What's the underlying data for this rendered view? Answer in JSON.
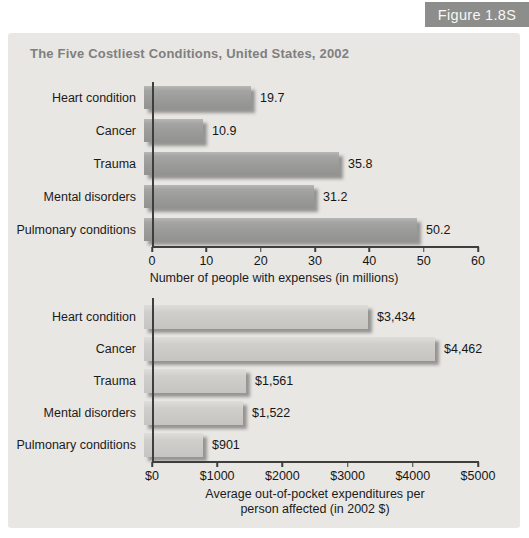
{
  "figure_tag": "Figure 1.8S",
  "title": "The Five Costliest Conditions, United States, 2002",
  "colors": {
    "panel_bg": "#e8e7e4",
    "figure_tag_bg": "#8d8d8b",
    "figure_tag_text": "#f7f7f5",
    "title_color": "#7f7f7f",
    "top_bar_fill": "#9d9d9b",
    "bottom_bar_fill": "#cccbc8",
    "axis_color": "#3e3e3c"
  },
  "chart_data": [
    {
      "type": "bar",
      "orientation": "horizontal",
      "categories": [
        "Heart condition",
        "Cancer",
        "Trauma",
        "Mental disorders",
        "Pulmonary conditions"
      ],
      "values": [
        19.7,
        10.9,
        35.8,
        31.2,
        50.2
      ],
      "value_labels": [
        "19.7",
        "10.9",
        "35.8",
        "31.2",
        "50.2"
      ],
      "xlabel": "Number of people with expenses (in millions)",
      "xlim": [
        0,
        60
      ],
      "xticks": [
        0,
        10,
        20,
        30,
        40,
        50,
        60
      ],
      "xtick_labels": [
        "0",
        "10",
        "20",
        "30",
        "40",
        "50",
        "60"
      ],
      "grid": false,
      "legend": false
    },
    {
      "type": "bar",
      "orientation": "horizontal",
      "categories": [
        "Heart condition",
        "Cancer",
        "Trauma",
        "Mental disorders",
        "Pulmonary conditions"
      ],
      "values": [
        3434,
        4462,
        1561,
        1522,
        901
      ],
      "value_labels": [
        "$3,434",
        "$4,462",
        "$1,561",
        "$1,522",
        "$901"
      ],
      "xlabel": "Average out-of-pocket expenditures per person affected (in 2002 $)",
      "xlabel_line1": "Average out-of-pocket expenditures per",
      "xlabel_line2": "person affected (in 2002 $)",
      "xlim": [
        0,
        5000
      ],
      "xticks": [
        0,
        1000,
        2000,
        3000,
        4000,
        5000
      ],
      "xtick_labels": [
        "$0",
        "$1000",
        "$2000",
        "$3000",
        "$4000",
        "$5000"
      ],
      "grid": false,
      "legend": false
    }
  ]
}
